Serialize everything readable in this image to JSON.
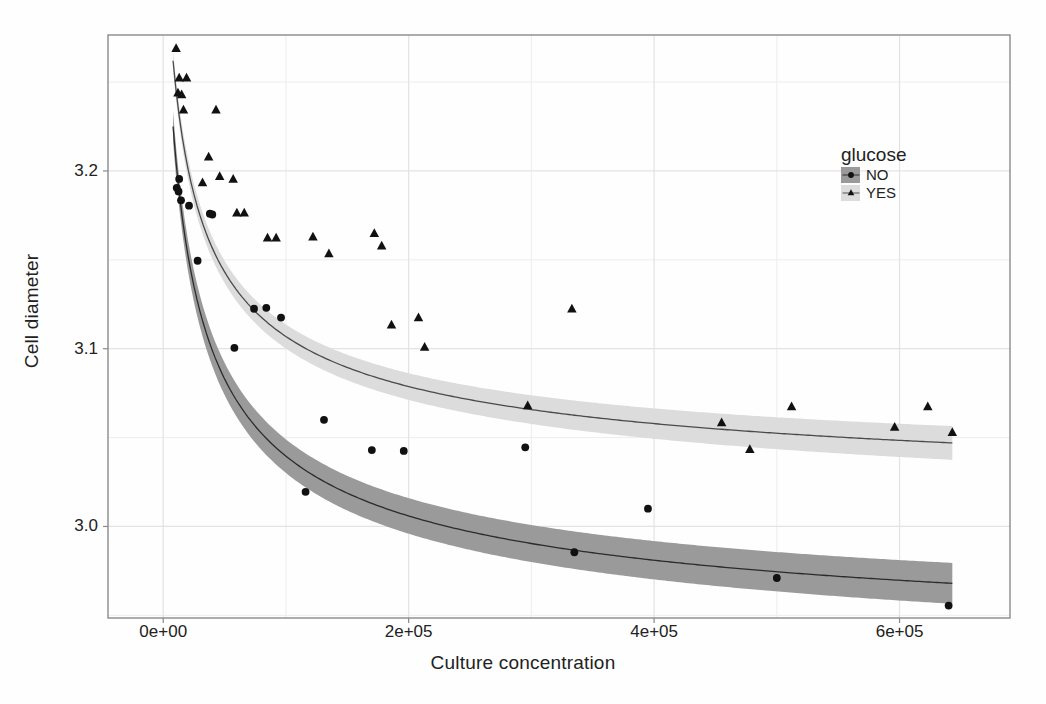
{
  "chart_data": {
    "type": "scatter",
    "title": "",
    "xlabel": "Culture concentration",
    "ylabel": "Cell diameter",
    "xlim": [
      -45000,
      690000
    ],
    "ylim": [
      2.9485,
      3.2765
    ],
    "xticks": [
      0,
      200000,
      400000,
      600000
    ],
    "xtick_labels": [
      "0e+00",
      "2e+05",
      "4e+05",
      "6e+05"
    ],
    "yticks": [
      3.0,
      3.1,
      3.2
    ],
    "ytick_labels": [
      "3.0",
      "3.1",
      "3.2"
    ],
    "yminor": [
      2.95,
      3.05,
      3.15,
      3.25
    ],
    "xminor": [
      100000,
      300000,
      500000
    ],
    "grid": true,
    "legend": {
      "title": "glucose",
      "position": "right-inside-top",
      "entries": [
        {
          "label": "NO",
          "marker": "circle",
          "band_color": "#9a9a9a",
          "line_color": "#2f2f2f"
        },
        {
          "label": "YES",
          "marker": "triangle",
          "band_color": "#dcdcdc",
          "line_color": "#555555"
        }
      ]
    },
    "series": [
      {
        "name": "NO",
        "marker": "circle",
        "color": "#111111",
        "band_color": "#9a9a9a",
        "line_color": "#2b2b2b",
        "points": [
          {
            "x": 11000,
            "y": 3.1905
          },
          {
            "x": 12500,
            "y": 3.1885
          },
          {
            "x": 13000,
            "y": 3.1955
          },
          {
            "x": 14500,
            "y": 3.1835
          },
          {
            "x": 21000,
            "y": 3.1805
          },
          {
            "x": 28000,
            "y": 3.1495
          },
          {
            "x": 38000,
            "y": 3.176
          },
          {
            "x": 40000,
            "y": 3.1755
          },
          {
            "x": 58000,
            "y": 3.1005
          },
          {
            "x": 74000,
            "y": 3.1225
          },
          {
            "x": 84000,
            "y": 3.123
          },
          {
            "x": 96000,
            "y": 3.1175
          },
          {
            "x": 116000,
            "y": 3.0195
          },
          {
            "x": 131000,
            "y": 3.06
          },
          {
            "x": 170000,
            "y": 3.043
          },
          {
            "x": 196000,
            "y": 3.0425
          },
          {
            "x": 295000,
            "y": 3.0445
          },
          {
            "x": 335000,
            "y": 2.9855
          },
          {
            "x": 395000,
            "y": 3.01
          },
          {
            "x": 500000,
            "y": 2.971
          },
          {
            "x": 640000,
            "y": 2.9555
          }
        ],
        "fit_curve": {
          "note": "y = a + b/sqrt(x+c) style decaying fit with 95% band",
          "x_from": 8000,
          "x_to": 643000,
          "y_at_x_from": 3.225,
          "y_at_x_to": 2.968,
          "band_halfwidth_at_from": 0.0085,
          "band_halfwidth_at_to": 0.0115
        }
      },
      {
        "name": "YES",
        "marker": "triangle",
        "color": "#111111",
        "band_color": "#dcdcdc",
        "line_color": "#4a4a4a",
        "points": [
          {
            "x": 10500,
            "y": 3.269
          },
          {
            "x": 13000,
            "y": 3.2525
          },
          {
            "x": 19000,
            "y": 3.2525
          },
          {
            "x": 12000,
            "y": 3.244
          },
          {
            "x": 15000,
            "y": 3.243
          },
          {
            "x": 16500,
            "y": 3.2345
          },
          {
            "x": 43000,
            "y": 3.2345
          },
          {
            "x": 37000,
            "y": 3.208
          },
          {
            "x": 46000,
            "y": 3.197
          },
          {
            "x": 57000,
            "y": 3.1955
          },
          {
            "x": 32000,
            "y": 3.1935
          },
          {
            "x": 60000,
            "y": 3.1765
          },
          {
            "x": 66000,
            "y": 3.1765
          },
          {
            "x": 85000,
            "y": 3.1625
          },
          {
            "x": 92000,
            "y": 3.1625
          },
          {
            "x": 122000,
            "y": 3.163
          },
          {
            "x": 135000,
            "y": 3.1535
          },
          {
            "x": 172000,
            "y": 3.165
          },
          {
            "x": 178000,
            "y": 3.158
          },
          {
            "x": 186000,
            "y": 3.1135
          },
          {
            "x": 208000,
            "y": 3.1175
          },
          {
            "x": 213000,
            "y": 3.101
          },
          {
            "x": 297000,
            "y": 3.068
          },
          {
            "x": 333000,
            "y": 3.1225
          },
          {
            "x": 455000,
            "y": 3.0585
          },
          {
            "x": 478000,
            "y": 3.0435
          },
          {
            "x": 512000,
            "y": 3.0675
          },
          {
            "x": 596000,
            "y": 3.056
          },
          {
            "x": 623000,
            "y": 3.0675
          },
          {
            "x": 643000,
            "y": 3.053
          }
        ],
        "fit_curve": {
          "note": "y = a + b/sqrt(x+c) style decaying fit with 95% band",
          "x_from": 8000,
          "x_to": 643000,
          "y_at_x_from": 3.262,
          "y_at_x_to": 3.047,
          "band_halfwidth_at_from": 0.0055,
          "band_halfwidth_at_to": 0.0095
        }
      }
    ]
  }
}
